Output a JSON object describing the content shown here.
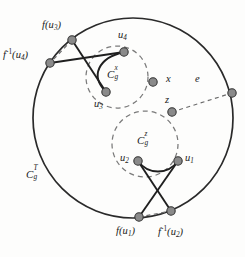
{
  "figure": {
    "caption_text": "",
    "colors": {
      "stroke": "#2a2a2a",
      "dashed": "#6b6b6b",
      "node_fill": "#8a8a8a",
      "node_stroke": "#3a3a3a",
      "background": "#fdfdfc"
    },
    "outer_curve": {
      "name": "C_g^T",
      "label_base": "C",
      "label_sub": "g",
      "label_sup": "T",
      "center": [
        133,
        118
      ],
      "radius": 100,
      "style": "solid"
    },
    "inner_curves": [
      {
        "name": "C_g^x",
        "label_base": "C",
        "label_sub": "g",
        "label_sup": "x",
        "center": [
          117,
          77
        ],
        "radius": 31,
        "style": "dashed"
      },
      {
        "name": "C_g^z",
        "label_base": "C",
        "label_sub": "g",
        "label_sup": "z",
        "center": [
          145,
          144
        ],
        "radius": 33,
        "style": "dashed"
      }
    ],
    "nodes": [
      {
        "id": "f_u3",
        "label": "f(u",
        "label_sub": "3",
        "label_tail": ")",
        "x": 72,
        "y": 40
      },
      {
        "id": "finv_u4",
        "label": "f",
        "label_sup": "-1",
        "label_tail": "(u",
        "label_sub": "4",
        "label_close": ")",
        "x": 50,
        "y": 63
      },
      {
        "id": "u4",
        "label": "u",
        "label_sub": "4",
        "x": 124,
        "y": 52
      },
      {
        "id": "u3",
        "label": "u",
        "label_sub": "3",
        "x": 106,
        "y": 92
      },
      {
        "id": "x",
        "label": "x",
        "x": 153,
        "y": 82
      },
      {
        "id": "z",
        "label": "z",
        "x": 172,
        "y": 112
      },
      {
        "id": "e_end",
        "label": "",
        "x": 232,
        "y": 93
      },
      {
        "id": "u2",
        "label": "u",
        "label_sub": "2",
        "x": 138,
        "y": 161
      },
      {
        "id": "u1",
        "label": "u",
        "label_sub": "1",
        "x": 178,
        "y": 161
      },
      {
        "id": "f_u1",
        "label": "f(u",
        "label_sub": "1",
        "label_tail": ")",
        "x": 139,
        "y": 217
      },
      {
        "id": "finv_u2",
        "label": "f",
        "label_sup": "-1",
        "label_tail": "(u",
        "label_sub": "2",
        "label_close": ")",
        "x": 171,
        "y": 211
      }
    ],
    "edges": [
      {
        "from": "f_u3",
        "to": "u3",
        "style": "solid"
      },
      {
        "from": "f_u3",
        "to": "finv_u4",
        "style": "dashed"
      },
      {
        "from": "finv_u4",
        "to": "u4",
        "style": "solid"
      },
      {
        "from": "u4",
        "to": "u3",
        "style": "solid-arc"
      },
      {
        "from": "u2",
        "to": "u1",
        "style": "solid-arc"
      },
      {
        "from": "u2",
        "to": "finv_u2",
        "style": "solid"
      },
      {
        "from": "u1",
        "to": "f_u1",
        "style": "solid"
      },
      {
        "from": "f_u1",
        "to": "finv_u2",
        "style": "dashed"
      },
      {
        "from": "z",
        "to": "e_end",
        "style": "dashed",
        "label": "e"
      }
    ],
    "labels": {
      "f_u3": {
        "base": "f(u",
        "sub": "3",
        "close": ")",
        "x": 42,
        "y": 23
      },
      "finv_u4": {
        "base": "f",
        "sup": "-1",
        "mid": "(u",
        "sub": "4",
        "close": ")",
        "x": 4,
        "y": 52
      },
      "u4": {
        "base": "u",
        "sub": "4",
        "x": 118,
        "y": 33
      },
      "u3": {
        "base": "u",
        "sub": "3",
        "x": 95,
        "y": 101
      },
      "x": {
        "base": "x",
        "x": 166,
        "y": 75
      },
      "z": {
        "base": "z",
        "x": 165,
        "y": 97
      },
      "e": {
        "base": "e",
        "x": 196,
        "y": 77
      },
      "u2": {
        "base": "u",
        "sub": "2",
        "x": 121,
        "y": 155
      },
      "u1": {
        "base": "u",
        "sub": "1",
        "x": 185,
        "y": 155
      },
      "f_u1": {
        "base": "f(u",
        "sub": "1",
        "close": ")",
        "x": 116,
        "y": 228
      },
      "finv_u2": {
        "base": "f",
        "sup": "-1",
        "mid": "(u",
        "sub": "2",
        "close": ")",
        "x": 159,
        "y": 228
      },
      "cg_x": {
        "base": "C",
        "sub": "g",
        "sup": "x",
        "x": 110,
        "y": 72
      },
      "cg_z": {
        "base": "C",
        "sub": "g",
        "sup": "z",
        "x": 140,
        "y": 138
      },
      "cg_T": {
        "base": "C",
        "sub": "g",
        "sup": "T",
        "x": 27,
        "y": 172
      }
    },
    "bleed_text": {
      "line1": "",
      "line2": ""
    }
  }
}
